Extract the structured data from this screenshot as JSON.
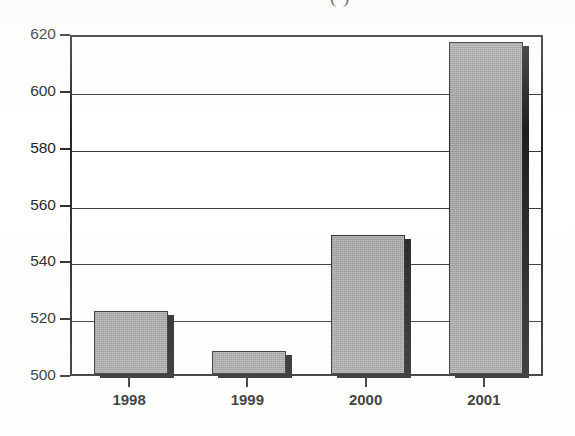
{
  "figure": {
    "caption_fragment": "(                    )",
    "background_color": "#ffffff"
  },
  "chart_data": {
    "type": "bar",
    "title": "",
    "subtitle": "",
    "xlabel": "",
    "ylabel": "",
    "categories": [
      "1998",
      "1999",
      "2000",
      "2001"
    ],
    "values": [
      522,
      508,
      549,
      617
    ],
    "series": [
      {
        "name": "",
        "values": [
          522,
          508,
          549,
          617
        ]
      }
    ],
    "ylim": [
      500,
      620
    ],
    "yticks": [
      500,
      520,
      540,
      560,
      580,
      600,
      620
    ],
    "ytick_labels": [
      "500",
      "520",
      "540",
      "560",
      "580",
      "600",
      "620"
    ],
    "grid": true,
    "grid_axis": "y",
    "legend": false,
    "legend_position": "none",
    "bar_fill_color": "#9b9b9b",
    "bar_edge_color": "#1b1b1b",
    "bar_shadow_color": "#121212",
    "axis_color": "#1a1a1a"
  }
}
